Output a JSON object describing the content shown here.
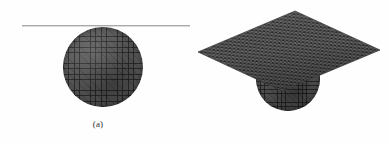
{
  "figure": {
    "background_color": "#fefefe",
    "panels": [
      {
        "id": "a",
        "caption": "(a)",
        "description": "Meshed sphere tangent to a horizontal line (2D cross-section view)",
        "objects": [
          {
            "name": "tangent-line",
            "type": "line",
            "color": "#a9a9a9",
            "x_start": 22,
            "x_end": 190,
            "y": 25
          },
          {
            "name": "meshed-sphere",
            "type": "sphere",
            "mesh": "quadrilateral-surface-mesh",
            "fill_color": "#585858",
            "center_x": 103,
            "center_y": 67,
            "radius": 40
          }
        ]
      },
      {
        "id": "b",
        "caption": "(b)",
        "description": "Meshed sphere penetrating a meshed square plate (3D perspective view)",
        "objects": [
          {
            "name": "meshed-plane",
            "type": "square-plate",
            "mesh": "triangular-surface-mesh",
            "fill_color": "#5c5c5c",
            "vertices": [
              [
                295,
                11
              ],
              [
                380,
                50
              ],
              [
                282,
                91
              ],
              [
                198,
                52
              ]
            ]
          },
          {
            "name": "meshed-sphere",
            "type": "sphere",
            "mesh": "quadrilateral-surface-mesh",
            "fill_color": "#545454",
            "center_x": 288,
            "center_y": 79,
            "radius": 32
          }
        ]
      }
    ]
  }
}
